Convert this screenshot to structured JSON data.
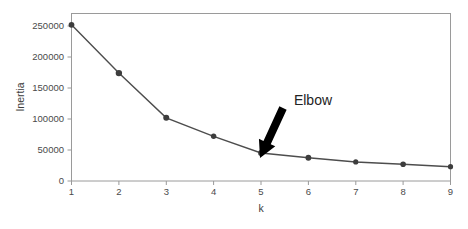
{
  "chart_data": {
    "type": "line",
    "title": "",
    "subtitle": "",
    "xlabel": "k",
    "ylabel": "Inertia",
    "x": [
      1,
      2,
      3,
      4,
      5,
      6,
      7,
      8,
      9
    ],
    "values": [
      262000,
      181000,
      106000,
      75000,
      47000,
      39000,
      32000,
      28000,
      24000
    ],
    "series": [
      {
        "name": "Inertia",
        "values": [
          262000,
          181000,
          106000,
          75000,
          47000,
          39000,
          32000,
          28000,
          24000
        ]
      }
    ],
    "xticks": [
      "1",
      "2",
      "3",
      "4",
      "5",
      "6",
      "7",
      "8",
      "9"
    ],
    "yticks": [
      "0",
      "50000",
      "100000",
      "150000",
      "200000",
      "250000"
    ],
    "ytick_values": [
      0,
      50000,
      100000,
      150000,
      200000,
      250000
    ],
    "xlim": [
      1,
      9
    ],
    "ylim": [
      0,
      281000
    ],
    "grid": false,
    "legend": null,
    "legend_position": "none",
    "marker": "circle",
    "line_color": "#4d4d4d",
    "marker_color": "#3d3d3d",
    "annotations": [
      {
        "label": "Elbow",
        "text_x": 313,
        "text_y": 100,
        "arrow_tail_x": 283,
        "arrow_tail_y": 108,
        "arrow_head_x": 260,
        "arrow_head_y": 158,
        "points_at_k": 5,
        "color": "#000000"
      }
    ]
  },
  "axes": {
    "y_title": "Inertia",
    "x_title": "k"
  },
  "colors": {
    "background": "#ffffff",
    "spine": "#9a9a9a",
    "tick_text": "#4a4a4a",
    "axis_title": "#3c3c3c",
    "annotation": "#232323",
    "arrow": "#000000"
  }
}
